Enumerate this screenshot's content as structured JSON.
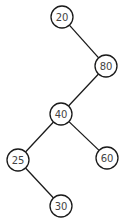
{
  "diagram": {
    "type": "binary-search-tree",
    "node_radius": 11,
    "colors": {
      "stroke": "#1a1a1a",
      "fill": "#ffffff",
      "text": "#444444",
      "background": "#ffffff"
    },
    "nodes": [
      {
        "id": "n20",
        "label": "20",
        "x": 62,
        "y": 17
      },
      {
        "id": "n80",
        "label": "80",
        "x": 106,
        "y": 66
      },
      {
        "id": "n40",
        "label": "40",
        "x": 61,
        "y": 114
      },
      {
        "id": "n25",
        "label": "25",
        "x": 18,
        "y": 160
      },
      {
        "id": "n60",
        "label": "60",
        "x": 107,
        "y": 158
      },
      {
        "id": "n30",
        "label": "30",
        "x": 61,
        "y": 206
      }
    ],
    "edges": [
      {
        "from": "n20",
        "to": "n80",
        "side": "right"
      },
      {
        "from": "n80",
        "to": "n40",
        "side": "left"
      },
      {
        "from": "n40",
        "to": "n25",
        "side": "left"
      },
      {
        "from": "n40",
        "to": "n60",
        "side": "right"
      },
      {
        "from": "n25",
        "to": "n30",
        "side": "right"
      }
    ]
  }
}
